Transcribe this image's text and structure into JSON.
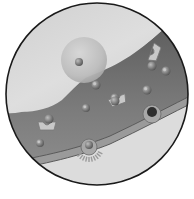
{
  "illustration": {
    "subject": "cell membrane signaling inset (grayscale)",
    "canvas": {
      "width": 194,
      "height": 199,
      "background": "#ffffff"
    },
    "circle": {
      "cx": 97,
      "cy": 94,
      "r": 91,
      "stroke": "#1a1a1a",
      "stroke_width": 1.6
    },
    "colors": {
      "upper_region": "#d2d2d2",
      "upper_region_highlight": "#e4e4e4",
      "band_dark": "#6e6e6e",
      "band_mid": "#858585",
      "membrane_line": "#5a5a5a",
      "membrane_fill": "#9a9a9a",
      "lower_region": "#dcdcdc",
      "vesicle": "#bdbdbd",
      "molecule": "#8a8a8a",
      "molecule_core": "#4a4a4a",
      "receptor": "#c8c8c8"
    },
    "vesicle": {
      "cx": 84,
      "cy": 60,
      "r": 23,
      "core": {
        "cx": 79,
        "cy": 62,
        "r": 4
      }
    },
    "molecules": [
      {
        "cx": 96,
        "cy": 85,
        "r": 4.5
      },
      {
        "cx": 166,
        "cy": 71,
        "r": 4.5
      },
      {
        "cx": 147,
        "cy": 90,
        "r": 4.5
      },
      {
        "cx": 86,
        "cy": 108,
        "r": 4
      },
      {
        "cx": 40,
        "cy": 143,
        "r": 4
      },
      {
        "cx": 115,
        "cy": 98,
        "r": 4.5
      }
    ],
    "receptors": [
      {
        "x": 148,
        "y": 60,
        "rot": -70,
        "ligand": {
          "cx": 152,
          "cy": 66,
          "r": 4.5
        }
      },
      {
        "x": 108,
        "y": 100,
        "rot": -20,
        "ligand": {
          "cx": 115,
          "cy": 101,
          "r": 4.5
        }
      },
      {
        "x": 38,
        "y": 122,
        "rot": 0,
        "ligand": {
          "cx": 49,
          "cy": 119,
          "r": 4.5
        }
      }
    ],
    "membrane_channels": [
      {
        "cx": 89,
        "cy": 147,
        "r": 8,
        "core_r": 4,
        "burst": true
      },
      {
        "cx": 152,
        "cy": 114,
        "r": 9,
        "core_r": 5,
        "burst": false
      }
    ]
  }
}
